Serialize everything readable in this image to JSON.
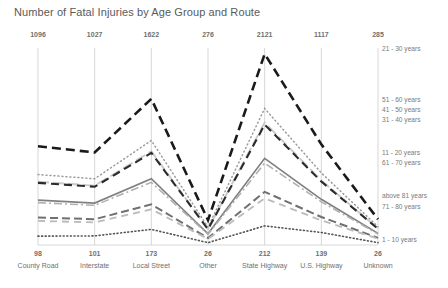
{
  "chart_data": {
    "type": "line",
    "title": "Number of Fatal Injuries by Age Group and Route",
    "xlabel": "",
    "ylabel": "",
    "grid": "vertical",
    "legend_position": "right",
    "categories": [
      "County Road",
      "Interstate",
      "Local Street",
      "Other",
      "State Highway",
      "U.S. Highway",
      "Unknown"
    ],
    "top_value_labels": [
      "1096",
      "1027",
      "1622",
      "276",
      "2121",
      "1117",
      "285"
    ],
    "bottom_value_labels": [
      "98",
      "101",
      "173",
      "26",
      "212",
      "139",
      "26"
    ],
    "series": [
      {
        "name": "21 - 30 years",
        "values": [
          1096,
          1027,
          1622,
          276,
          2121,
          1117,
          285
        ],
        "style": "thick-dashed",
        "color": "#1a1a1a"
      },
      {
        "name": "51 - 60 years",
        "values": [
          782,
          735,
          1160,
          198,
          1516,
          800,
          204
        ],
        "style": "dotted",
        "color": "#9a9a9a"
      },
      {
        "name": "41 - 50 years",
        "values": [
          702,
          659,
          1040,
          177,
          1359,
          716,
          183
        ],
        "style": "light-dashed",
        "color": "#c9c9c9"
      },
      {
        "name": "31 - 40 years",
        "values": [
          690,
          647,
          1022,
          174,
          1336,
          704,
          180
        ],
        "style": "dashed",
        "color": "#2b2b2b"
      },
      {
        "name": "11 - 20 years",
        "values": [
          498,
          466,
          736,
          125,
          962,
          507,
          129
        ],
        "style": "solid",
        "color": "#808080"
      },
      {
        "name": "61 - 70 years",
        "values": [
          470,
          440,
          695,
          118,
          909,
          479,
          122
        ],
        "style": "dash-dot",
        "color": "#b0b0b0"
      },
      {
        "name": "71 - 80 years",
        "values": [
          305,
          286,
          451,
          77,
          590,
          311,
          79
        ],
        "style": "medium-dashed",
        "color": "#707070"
      },
      {
        "name": "above 81 years",
        "values": [
          268,
          251,
          396,
          67,
          518,
          273,
          70
        ],
        "style": "sparse-dashed",
        "color": "#bcbcbc"
      },
      {
        "name": "1 - 10 years",
        "values": [
          98,
          101,
          173,
          26,
          212,
          139,
          26
        ],
        "style": "fine-dotted",
        "color": "#555555"
      }
    ],
    "legend_entries": [
      {
        "label": "21 - 30 years",
        "y": 49
      },
      {
        "label": "51 - 60 years",
        "y": 100
      },
      {
        "label": "41 - 50 years",
        "y": 110
      },
      {
        "label": "31 - 40 years",
        "y": 120
      },
      {
        "label": "11 - 20 years",
        "y": 153
      },
      {
        "label": "61 - 70 years",
        "y": 163
      },
      {
        "label": "above 81 years",
        "y": 196
      },
      {
        "label": "71 - 80 years",
        "y": 207
      },
      {
        "label": "1 - 10 years",
        "y": 240
      }
    ]
  }
}
